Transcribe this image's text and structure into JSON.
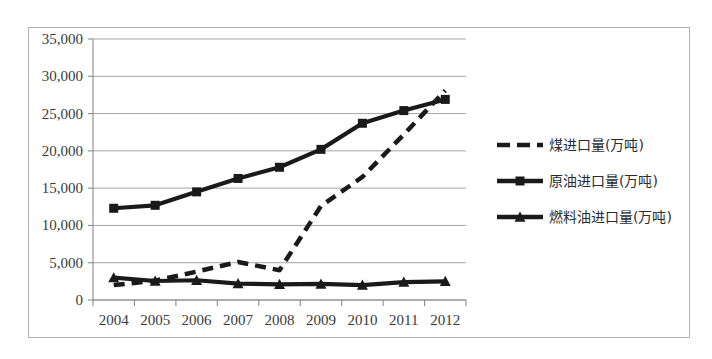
{
  "chart_data": {
    "type": "line",
    "title": "",
    "subtitle": "",
    "xlabel": "",
    "ylabel": "",
    "categories": [
      "2004",
      "2005",
      "2006",
      "2007",
      "2008",
      "2009",
      "2010",
      "2011",
      "2012"
    ],
    "x_tick_labels": [
      "2004",
      "2005",
      "2006",
      "2007",
      "2008",
      "2009",
      "2010",
      "2011",
      "2012"
    ],
    "y_tick_labels": [
      "0",
      "5,000",
      "10,000",
      "15,000",
      "20,000",
      "25,000",
      "30,000",
      "35,000"
    ],
    "y_tick_values": [
      0,
      5000,
      10000,
      15000,
      20000,
      25000,
      30000,
      35000
    ],
    "ylim": [
      0,
      35000
    ],
    "grid": true,
    "grid_axis": "y",
    "legend_position": "right",
    "series": [
      {
        "name": "煤进口量(万吨)",
        "style": "dashed",
        "marker": "none",
        "color": "#1a1a1a",
        "values": [
          2000,
          2600,
          3800,
          5100,
          4000,
          12600,
          16500,
          22200,
          28100
        ]
      },
      {
        "name": "原油进口量(万吨)",
        "style": "solid",
        "marker": "square",
        "color": "#1a1a1a",
        "values": [
          12300,
          12700,
          14500,
          16300,
          17800,
          20200,
          23700,
          25400,
          26900
        ]
      },
      {
        "name": "燃料油进口量(万吨)",
        "style": "solid",
        "marker": "triangle",
        "color": "#1a1a1a",
        "values": [
          3000,
          2550,
          2650,
          2200,
          2100,
          2150,
          2000,
          2400,
          2500
        ]
      }
    ]
  },
  "legend": {
    "entries": [
      {
        "label": "煤进口量(万吨)",
        "marker": "dashed-line"
      },
      {
        "label": "原油进口量(万吨)",
        "marker": "square-line"
      },
      {
        "label": "燃料油进口量(万吨)",
        "marker": "triangle-line"
      }
    ]
  },
  "axes": {
    "y_labels": [
      "35,000",
      "30,000",
      "25,000",
      "20,000",
      "15,000",
      "10,000",
      "5,000",
      "0"
    ],
    "x_labels": [
      "2004",
      "2005",
      "2006",
      "2007",
      "2008",
      "2009",
      "2010",
      "2011",
      "2012"
    ]
  },
  "colors": {
    "ink": "#1a1a1a",
    "grid": "#9a9a9a",
    "frame": "#b0b0b0",
    "text": "#3a3a3a",
    "background": "#ffffff"
  }
}
